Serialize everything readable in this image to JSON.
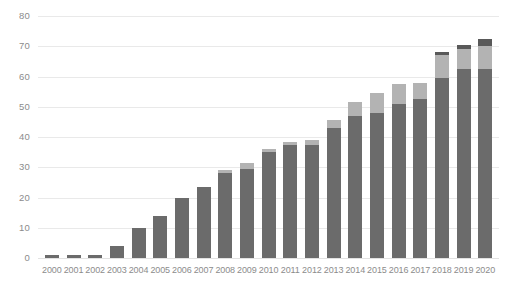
{
  "chart_data": {
    "type": "bar",
    "title": "",
    "subtitle": "",
    "xlabel": "",
    "ylabel": "",
    "stacked": true,
    "grid": true,
    "legend_position": "none",
    "ylim": [
      0,
      80
    ],
    "yticks": [
      0,
      10,
      20,
      30,
      40,
      50,
      60,
      70,
      80
    ],
    "ytick_labels": [
      "0",
      "10",
      "20",
      "30",
      "40",
      "50",
      "60",
      "70",
      "80"
    ],
    "categories": [
      "2000",
      "2001",
      "2002",
      "2003",
      "2004",
      "2005",
      "2006",
      "2007",
      "2008",
      "2009",
      "2010",
      "2011",
      "2012",
      "2013",
      "2014",
      "2015",
      "2016",
      "2017",
      "2018",
      "2019",
      "2020"
    ],
    "series": [
      {
        "name": "series-1",
        "color": "#6b6b6b",
        "values": [
          1.0,
          1.0,
          1.0,
          4.0,
          10.0,
          14.0,
          20.0,
          23.5,
          28.0,
          29.5,
          35.0,
          37.5,
          37.5,
          43.0,
          47.0,
          48.0,
          51.0,
          52.5,
          59.5,
          62.5,
          62.5
        ]
      },
      {
        "name": "series-2",
        "color": "#b3b3b3",
        "values": [
          0.0,
          0.0,
          0.0,
          0.0,
          0.0,
          0.0,
          0.0,
          0.0,
          1.0,
          2.0,
          1.0,
          1.0,
          1.5,
          2.5,
          4.5,
          6.5,
          6.5,
          5.5,
          7.5,
          6.5,
          7.5
        ]
      },
      {
        "name": "series-3",
        "color": "#595959",
        "values": [
          0.0,
          0.0,
          0.0,
          0.0,
          0.0,
          0.0,
          0.0,
          0.0,
          0.0,
          0.0,
          0.0,
          0.0,
          0.0,
          0.0,
          0.0,
          0.0,
          0.0,
          0.0,
          1.0,
          1.5,
          2.5
        ]
      }
    ],
    "totals": [
      1.0,
      1.0,
      1.0,
      4.0,
      10.0,
      14.0,
      20.0,
      23.5,
      29.0,
      31.5,
      36.0,
      38.5,
      39.0,
      45.5,
      51.5,
      54.5,
      57.5,
      58.0,
      68.0,
      70.5,
      72.5
    ],
    "colors": {
      "grid": "#e9e9e9",
      "axis_text": "#8c8c8c",
      "background": "#ffffff"
    }
  }
}
